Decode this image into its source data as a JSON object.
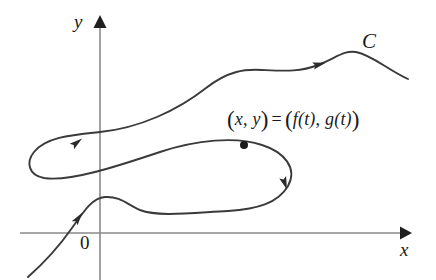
{
  "figure": {
    "background_color": "#ffffff",
    "axis_color": "#8a8a8a",
    "curve_color": "#3a3a3a",
    "labels": {
      "y_axis": "y",
      "x_axis": "x",
      "origin": "0",
      "curve_name": "C",
      "point_expression": {
        "lhs_open": "(",
        "lhs_x": "x",
        "lhs_comma": ", ",
        "lhs_y": "y",
        "lhs_close": ")",
        "equals": "=",
        "rhs_open": "(",
        "rhs_f": "f",
        "rhs_f_open": "(",
        "rhs_f_arg": "t",
        "rhs_f_close": ")",
        "rhs_comma": ", ",
        "rhs_g": "g",
        "rhs_g_open": "(",
        "rhs_g_arg": "t",
        "rhs_g_close": ")",
        "rhs_close": ")",
        "full_text": "(x, y) = (f(t), g(t))"
      }
    }
  },
  "chart_data": {
    "type": "line",
    "xlabel": "x",
    "ylabel": "y",
    "grid": false,
    "legend": null,
    "axes": {
      "origin_px": [
        100,
        233
      ],
      "x_axis_y_px": 233,
      "y_axis_x_px": 100,
      "x_axis_extent_px": [
        20,
        408
      ],
      "y_axis_extent_px": [
        18,
        280
      ],
      "x_arrow_tip_px": [
        408,
        233
      ],
      "y_arrow_tip_px": [
        100,
        18
      ],
      "origin_label": "0"
    },
    "series": [
      {
        "name": "C",
        "description": "Single continuous parametric curve traced from lower-left, looping twice, ending at right",
        "direction_arrows": [
          {
            "position_px": [
              76,
              221
            ],
            "angle_deg": -55,
            "note": "lower-left ascending branch"
          },
          {
            "position_px": [
              74,
              145
            ],
            "angle_deg": -38,
            "note": "outer loop upper-left"
          },
          {
            "position_px": [
              283,
              180
            ],
            "angle_deg": 70,
            "note": "inner loop right side descending"
          },
          {
            "position_px": [
              316,
              65
            ],
            "angle_deg": -17,
            "note": "upper right branch"
          }
        ],
        "marked_point": {
          "label": "(x, y) = (f(t), g(t))",
          "position_px": [
            244,
            145
          ],
          "radius_px": 4
        },
        "path_px": "M 28,277 C 45,262 58,248 72,228 C 86,208 93,198 105,197 C 120,196 128,205 140,210 C 158,217 190,213 228,211 C 258,209 278,203 288,186 C 298,168 284,152 262,145 C 236,136 196,140 160,152 C 118,166 70,182 44,178 C 28,175 26,162 34,152 C 46,137 72,135 100,132 C 140,128 178,110 206,88 C 228,71 244,69 262,70 C 286,71 300,72 318,65 C 336,58 344,50 356,52 C 372,55 388,70 408,79"
      }
    ],
    "annotations": [
      {
        "text": "C",
        "position_px": [
          368,
          42
        ],
        "style": "italic"
      },
      {
        "text": "(x, y) = (f(t), g(t))",
        "position_px": [
          306,
          119
        ],
        "style": "italic-math"
      },
      {
        "text": "y",
        "position_px": [
          82,
          21
        ],
        "style": "italic"
      },
      {
        "text": "x",
        "position_px": [
          406,
          249
        ],
        "style": "italic"
      },
      {
        "text": "0",
        "position_px": [
          86,
          243
        ],
        "style": "roman"
      }
    ]
  }
}
